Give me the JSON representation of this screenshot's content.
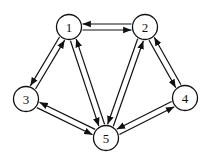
{
  "diagram": {
    "type": "directed-graph",
    "nodes": [
      {
        "id": "1",
        "label": "1"
      },
      {
        "id": "2",
        "label": "2"
      },
      {
        "id": "3",
        "label": "3"
      },
      {
        "id": "4",
        "label": "4"
      },
      {
        "id": "5",
        "label": "5"
      }
    ],
    "edges": [
      {
        "from": "1",
        "to": "2"
      },
      {
        "from": "2",
        "to": "1"
      },
      {
        "from": "1",
        "to": "3"
      },
      {
        "from": "3",
        "to": "1"
      },
      {
        "from": "1",
        "to": "5"
      },
      {
        "from": "5",
        "to": "1"
      },
      {
        "from": "2",
        "to": "5"
      },
      {
        "from": "5",
        "to": "2"
      },
      {
        "from": "2",
        "to": "4"
      },
      {
        "from": "4",
        "to": "2"
      },
      {
        "from": "3",
        "to": "5"
      },
      {
        "from": "5",
        "to": "3"
      },
      {
        "from": "4",
        "to": "5"
      },
      {
        "from": "5",
        "to": "4"
      }
    ],
    "colors": {
      "stroke": "#111111",
      "fill": "#ffffff"
    }
  }
}
